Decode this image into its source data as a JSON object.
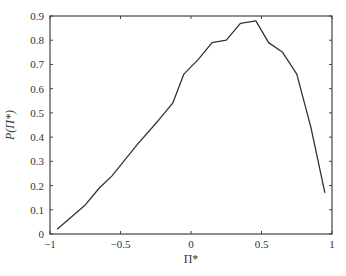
{
  "chart_data": {
    "type": "line",
    "title": "",
    "xlabel": "Π*",
    "ylabel": "P(Π*)",
    "xlim": [
      -1,
      1
    ],
    "ylim": [
      0,
      0.9
    ],
    "grid": false,
    "legend": null,
    "xticks": [
      -1,
      -0.5,
      0,
      0.5,
      1
    ],
    "xtick_labels": [
      "−1",
      "−0.5",
      "0",
      "0.5",
      "1"
    ],
    "yticks": [
      0,
      0.1,
      0.2,
      0.3,
      0.4,
      0.5,
      0.6,
      0.7,
      0.8,
      0.9
    ],
    "ytick_labels": [
      "0",
      "0.1",
      "0.2",
      "0.3",
      "0.4",
      "0.5",
      "0.6",
      "0.7",
      "0.8",
      "0.9"
    ],
    "series": [
      {
        "name": "P(Π*)",
        "color": "#333333",
        "x": [
          -0.95,
          -0.75,
          -0.65,
          -0.56,
          -0.38,
          -0.23,
          -0.13,
          -0.05,
          0.05,
          0.15,
          0.25,
          0.35,
          0.46,
          0.55,
          0.65,
          0.75,
          0.85,
          0.95
        ],
        "y": [
          0.02,
          0.12,
          0.19,
          0.24,
          0.37,
          0.47,
          0.54,
          0.66,
          0.72,
          0.79,
          0.8,
          0.87,
          0.88,
          0.79,
          0.75,
          0.66,
          0.44,
          0.17
        ]
      }
    ]
  }
}
